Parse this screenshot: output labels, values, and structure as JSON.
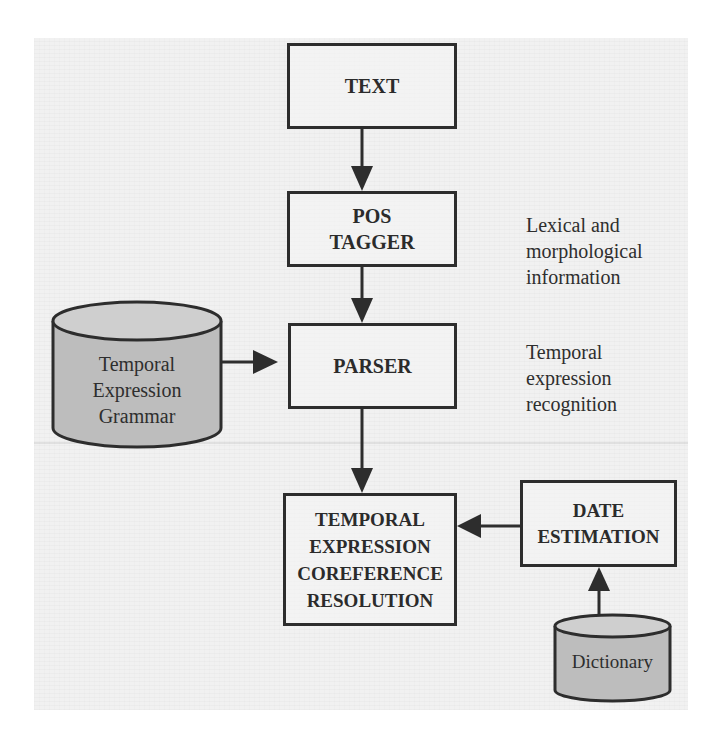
{
  "diagram": {
    "type": "flowchart",
    "colors": {
      "panel_background": "#f1f1f1",
      "box_border": "#2d2d2d",
      "database_fill": "#bdbdbd",
      "database_top_fill": "#cfcfcf",
      "text": "#2b2b2b"
    },
    "nodes": {
      "text": {
        "lines": [
          "TEXT"
        ]
      },
      "pos_tagger": {
        "lines": [
          "POS",
          "TAGGER"
        ]
      },
      "parser": {
        "lines": [
          "PARSER"
        ]
      },
      "coreference": {
        "lines": [
          "TEMPORAL",
          "EXPRESSION",
          "COREFERENCE",
          "RESOLUTION"
        ]
      },
      "date_estimation": {
        "lines": [
          "DATE",
          "ESTIMATION"
        ]
      }
    },
    "databases": {
      "grammar": {
        "lines": [
          "Temporal",
          "Expression",
          "Grammar"
        ]
      },
      "dictionary": {
        "lines": [
          "Dictionary"
        ]
      }
    },
    "annotations": {
      "lexical": {
        "lines": [
          "Lexical and",
          "morphological",
          "information"
        ]
      },
      "recognition": {
        "lines": [
          "Temporal",
          "expression",
          "recognition"
        ]
      }
    },
    "edges": [
      {
        "from": "TEXT",
        "to": "POS TAGGER"
      },
      {
        "from": "POS TAGGER",
        "to": "PARSER"
      },
      {
        "from": "Temporal Expression Grammar",
        "to": "PARSER"
      },
      {
        "from": "PARSER",
        "to": "TEMPORAL EXPRESSION COREFERENCE RESOLUTION"
      },
      {
        "from": "DATE ESTIMATION",
        "to": "TEMPORAL EXPRESSION COREFERENCE RESOLUTION"
      },
      {
        "from": "Dictionary",
        "to": "DATE ESTIMATION"
      }
    ]
  }
}
